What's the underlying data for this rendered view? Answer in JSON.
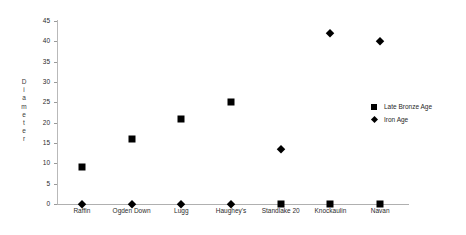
{
  "chart_data": {
    "type": "scatter",
    "title": "",
    "xlabel": "",
    "ylabel": "Diameter",
    "ylabel_vertical_letters": "D\ni\na\nm\ne\nt\ne\nr",
    "categories": [
      "Raffin",
      "Ogden Down",
      "Lugg",
      "Haughey's",
      "Standlake 20",
      "Knockaulin",
      "Navan"
    ],
    "ylim": [
      0,
      45
    ],
    "yticks": [
      0,
      5,
      10,
      15,
      20,
      25,
      30,
      35,
      40,
      45
    ],
    "ytick_labels": [
      "0",
      "5",
      "10",
      "15",
      "20",
      "25",
      "30",
      "35",
      "40",
      "45"
    ],
    "grid": false,
    "legend_position": "right",
    "series": [
      {
        "name": "Late Bronze Age",
        "marker": "square",
        "color": "#000000",
        "values": [
          9,
          16,
          21,
          25,
          0,
          0,
          0
        ]
      },
      {
        "name": "Iron Age",
        "marker": "diamond",
        "color": "#000000",
        "values": [
          0,
          0,
          0,
          0,
          13.5,
          42,
          40
        ]
      }
    ]
  },
  "legend": {
    "items": [
      {
        "label": "Late Bronze Age",
        "marker": "square"
      },
      {
        "label": "Iron Age",
        "marker": "diamond"
      }
    ]
  }
}
